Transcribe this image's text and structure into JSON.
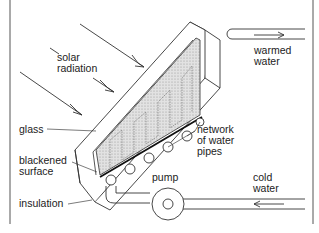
{
  "diagram": {
    "labels": {
      "solar_radiation": "solar\nradiation",
      "warmed_water": "warmed\nwater",
      "glass": "glass",
      "network_of_water_pipes": "network\nof water\npipes",
      "blackened_surface": "blackened\nsurface",
      "pump": "pump",
      "insulation": "insulation",
      "cold_water": "cold\nwater"
    },
    "colors": {
      "line": "#333333",
      "glass_fill": "#d9d9d9",
      "frame": "#555555"
    }
  }
}
